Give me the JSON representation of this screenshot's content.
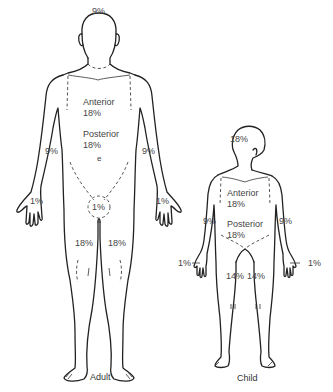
{
  "adult": {
    "caption": "Adult",
    "head": "9%",
    "trunk_anterior_label": "Anterior",
    "trunk_anterior_value": "18%",
    "trunk_posterior_label": "Posterior",
    "trunk_posterior_value": "18%",
    "navel_mark": "e",
    "arm_left": "9%",
    "arm_right": "9%",
    "hand_left": "1%",
    "hand_right": "1%",
    "perineum": "1%",
    "leg_left": "18%",
    "leg_right": "18%"
  },
  "child": {
    "caption": "Child",
    "head": "18%",
    "trunk_anterior_label": "Anterior",
    "trunk_anterior_value": "18%",
    "trunk_posterior_label": "Posterior",
    "trunk_posterior_value": "18%",
    "arm_left": "9%",
    "arm_right": "9%",
    "hand_left": "1%",
    "hand_right": "1%",
    "leg_left": "14%",
    "leg_right": "14%"
  },
  "colors": {
    "line": "#222222",
    "text": "#444444",
    "background": "#ffffff"
  }
}
